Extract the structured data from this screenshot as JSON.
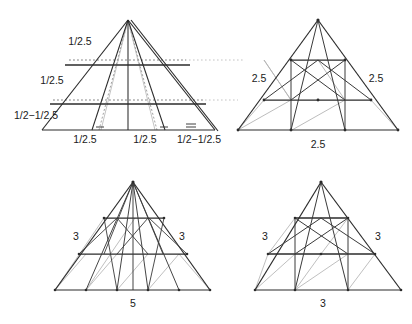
{
  "figure": {
    "background_color": "#ffffff",
    "stroke_dark": "#2b2b2b",
    "stroke_mid": "#555555",
    "stroke_light": "#b4b4b4",
    "stroke_dotted": "#bdbdbd",
    "text_color": "#1a1a1a",
    "panels": [
      {
        "id": "panel-top-left",
        "name": "triangle-subdivision-top-left",
        "labels": {
          "left_upper": "1/2.5",
          "left_middle": "1/2.5",
          "left_lower": "1/2−1/2.5",
          "base_left": "1/2.5",
          "base_center": "1/2.5",
          "base_right": "1/2−1/2.5"
        }
      },
      {
        "id": "panel-top-right",
        "name": "triangle-subdivision-top-right",
        "labels": {
          "left_side": "2.5",
          "right_side": "2.5",
          "base": "2.5"
        }
      },
      {
        "id": "panel-bottom-left",
        "name": "triangle-subdivision-bottom-left",
        "labels": {
          "left_side": "3",
          "right_side": "3",
          "base": "5"
        }
      },
      {
        "id": "panel-bottom-right",
        "name": "triangle-subdivision-bottom-right",
        "labels": {
          "left_side": "3",
          "right_side": "3",
          "base": "3"
        }
      }
    ]
  }
}
